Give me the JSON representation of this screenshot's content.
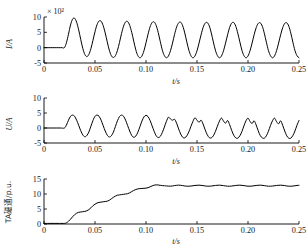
{
  "figure": {
    "background": "#ffffff",
    "line_color": "#000000",
    "panel_count": 3
  },
  "chart_data": [
    {
      "type": "line",
      "title": "",
      "xlabel": "t/s",
      "ylabel": "I/A",
      "y_multiplier": "× 10²",
      "xlim": [
        0,
        0.25
      ],
      "ylim": [
        -5,
        10
      ],
      "xticks": [
        0,
        0.05,
        0.1,
        0.15,
        0.2,
        0.25
      ],
      "xticklabels": [
        "0",
        "0.05",
        "0.10",
        "0.15",
        "0.20",
        "0.25"
      ],
      "yticks": [
        -5,
        0,
        5,
        10
      ],
      "yticklabels": [
        "-5",
        "0",
        "5",
        "10"
      ],
      "grid": false,
      "legend": "none",
      "description": "Primary current: flat at 0 until 0.02 s, then a 50 Hz sinusoid with DC offset; first peak ~9.7, decaying to a steady swing between about -3 and 7.",
      "series": [
        {
          "name": "I",
          "x": [
            0,
            0.002,
            0.004,
            0.006,
            0.008,
            0.01,
            0.012,
            0.014,
            0.016,
            0.018,
            0.02,
            0.022,
            0.024,
            0.026,
            0.028,
            0.03,
            0.032,
            0.034,
            0.036,
            0.038,
            0.04,
            0.042,
            0.044,
            0.046,
            0.048,
            0.05,
            0.052,
            0.054,
            0.056,
            0.058,
            0.06,
            0.062,
            0.064,
            0.066,
            0.068,
            0.07,
            0.072,
            0.074,
            0.076,
            0.078,
            0.08,
            0.082,
            0.084,
            0.086,
            0.088,
            0.09,
            0.092,
            0.094,
            0.096,
            0.098,
            0.1,
            0.102,
            0.104,
            0.106,
            0.108,
            0.11,
            0.112,
            0.114,
            0.116,
            0.118,
            0.12,
            0.122,
            0.124,
            0.126,
            0.128,
            0.13,
            0.132,
            0.134,
            0.136,
            0.138,
            0.14,
            0.142,
            0.144,
            0.146,
            0.148,
            0.15,
            0.152,
            0.154,
            0.156,
            0.158,
            0.16,
            0.162,
            0.164,
            0.166,
            0.168,
            0.17,
            0.172,
            0.174,
            0.176,
            0.178,
            0.18,
            0.182,
            0.184,
            0.186,
            0.188,
            0.19,
            0.192,
            0.194,
            0.196,
            0.198,
            0.2,
            0.202,
            0.204,
            0.206,
            0.208,
            0.21,
            0.212,
            0.214,
            0.216,
            0.218,
            0.22,
            0.222,
            0.224,
            0.226,
            0.228,
            0.23,
            0.232,
            0.234,
            0.236,
            0.238,
            0.24,
            0.242,
            0.244,
            0.246,
            0.248,
            0.25
          ],
          "y": [
            0,
            0,
            0,
            0,
            0,
            0,
            0,
            0,
            0,
            0,
            0,
            1.6,
            4.4,
            7.4,
            9.3,
            9.6,
            8.3,
            5.8,
            2.7,
            -0.2,
            -2.2,
            -2.9,
            -2.2,
            -0.3,
            2.4,
            5.2,
            7.5,
            8.7,
            8.6,
            7.2,
            4.8,
            1.9,
            -0.8,
            -2.6,
            -3.2,
            -2.6,
            -0.9,
            1.7,
            4.6,
            7.0,
            8.4,
            8.5,
            7.3,
            5.0,
            2.1,
            -0.7,
            -2.6,
            -3.3,
            -2.7,
            -1.0,
            1.6,
            4.4,
            6.8,
            8.2,
            8.4,
            7.2,
            4.9,
            2.0,
            -0.8,
            -2.6,
            -3.3,
            -2.7,
            -1.0,
            1.5,
            4.3,
            6.7,
            8.1,
            8.3,
            7.1,
            4.8,
            1.9,
            -0.8,
            -2.6,
            -3.3,
            -2.7,
            -1.0,
            1.5,
            4.2,
            6.6,
            8.0,
            8.2,
            7.1,
            4.8,
            1.9,
            -0.8,
            -2.6,
            -3.3,
            -2.7,
            -1.0,
            1.5,
            4.2,
            6.6,
            8.0,
            8.2,
            7.0,
            4.7,
            1.9,
            -0.8,
            -2.6,
            -3.3,
            -2.7,
            -1.0,
            1.5,
            4.2,
            6.5,
            7.9,
            8.1,
            7.0,
            4.7,
            1.8,
            -0.9,
            -2.6,
            -3.3,
            -2.7,
            -1.0,
            1.5,
            4.2,
            6.5,
            7.9,
            8.1,
            7.0,
            4.7,
            1.8,
            -0.9,
            -2.6,
            -3.3
          ]
        }
      ]
    },
    {
      "type": "line",
      "title": "",
      "xlabel": "t/s",
      "ylabel": "U/A",
      "y_multiplier": "",
      "xlim": [
        0,
        0.25
      ],
      "ylim": [
        -5,
        10
      ],
      "xticks": [
        0,
        0.05,
        0.1,
        0.15,
        0.2,
        0.25
      ],
      "xticklabels": [
        "0",
        "0.05",
        "0.10",
        "0.15",
        "0.20",
        "0.25"
      ],
      "yticks": [
        -5,
        0,
        5,
        10
      ],
      "yticklabels": [
        "-5",
        "0",
        "5",
        "10"
      ],
      "grid": false,
      "legend": "none",
      "description": "Secondary current: zero until 0.02 s, clean sinusoid of about ±4 until roughly 0.11 s, then progressively distorted saturated waveform with notched, sawtooth-shaped peaks.",
      "series": [
        {
          "name": "U",
          "x": [
            0,
            0.004,
            0.008,
            0.012,
            0.016,
            0.02,
            0.022,
            0.024,
            0.026,
            0.028,
            0.03,
            0.032,
            0.034,
            0.036,
            0.038,
            0.04,
            0.042,
            0.044,
            0.046,
            0.048,
            0.05,
            0.052,
            0.054,
            0.056,
            0.058,
            0.06,
            0.062,
            0.064,
            0.066,
            0.068,
            0.07,
            0.072,
            0.074,
            0.076,
            0.078,
            0.08,
            0.082,
            0.084,
            0.086,
            0.088,
            0.09,
            0.092,
            0.094,
            0.096,
            0.098,
            0.1,
            0.102,
            0.104,
            0.106,
            0.108,
            0.11,
            0.112,
            0.114,
            0.116,
            0.118,
            0.12,
            0.122,
            0.124,
            0.126,
            0.128,
            0.13,
            0.132,
            0.134,
            0.136,
            0.138,
            0.14,
            0.142,
            0.144,
            0.146,
            0.148,
            0.15,
            0.152,
            0.154,
            0.156,
            0.158,
            0.16,
            0.162,
            0.164,
            0.166,
            0.168,
            0.17,
            0.172,
            0.174,
            0.176,
            0.178,
            0.18,
            0.182,
            0.184,
            0.186,
            0.188,
            0.19,
            0.192,
            0.194,
            0.196,
            0.198,
            0.2,
            0.202,
            0.204,
            0.206,
            0.208,
            0.21,
            0.212,
            0.214,
            0.216,
            0.218,
            0.22,
            0.222,
            0.224,
            0.226,
            0.228,
            0.23,
            0.232,
            0.234,
            0.236,
            0.238,
            0.24,
            0.242,
            0.244,
            0.246,
            0.248,
            0.25
          ],
          "y": [
            0,
            0,
            0,
            0,
            0,
            0,
            1.0,
            2.6,
            3.9,
            4.3,
            3.9,
            2.6,
            0.9,
            -0.9,
            -2.3,
            -2.9,
            -2.5,
            -1.3,
            0.6,
            2.5,
            3.9,
            4.3,
            3.9,
            2.6,
            0.8,
            -1.0,
            -2.4,
            -3.0,
            -2.6,
            -1.4,
            0.5,
            2.4,
            3.8,
            4.3,
            3.9,
            2.6,
            0.8,
            -1.0,
            -2.5,
            -3.1,
            -2.7,
            -1.4,
            0.4,
            2.3,
            3.7,
            4.2,
            3.8,
            2.5,
            0.7,
            -1.1,
            -2.6,
            -3.2,
            -2.8,
            -1.5,
            0.3,
            2.2,
            3.6,
            3.0,
            2.6,
            2.9,
            1.6,
            -0.3,
            -2.0,
            -3.1,
            -3.3,
            -2.6,
            -1.3,
            0.5,
            2.2,
            3.4,
            2.6,
            1.9,
            2.6,
            1.3,
            -0.6,
            -2.2,
            -3.2,
            -3.3,
            -2.6,
            -1.2,
            0.6,
            2.3,
            3.3,
            2.3,
            1.6,
            2.5,
            1.1,
            -0.8,
            -2.4,
            -3.3,
            -3.4,
            -2.6,
            -1.2,
            0.7,
            2.4,
            3.3,
            2.2,
            1.5,
            2.4,
            1.0,
            -0.9,
            -2.5,
            -3.3,
            -3.4,
            -2.6,
            -1.1,
            0.8,
            2.4,
            3.3,
            2.1,
            1.4,
            2.4,
            0.9,
            -1.0,
            -2.6,
            -3.4,
            -3.4,
            -2.5,
            -1.0,
            0.9,
            2.5,
            3.3
          ]
        }
      ]
    },
    {
      "type": "line",
      "title": "",
      "xlabel": "t/s",
      "ylabel": "TA磁通/p.u.",
      "y_multiplier": "",
      "xlim": [
        0,
        0.25
      ],
      "ylim": [
        0,
        15
      ],
      "xticks": [
        0,
        0.05,
        0.1,
        0.15,
        0.2,
        0.25
      ],
      "xticklabels": [
        "0",
        "0.05",
        "0.10",
        "0.15",
        "0.20",
        "0.25"
      ],
      "yticks": [
        0,
        5,
        10,
        15
      ],
      "yticklabels": [
        "0",
        "5",
        "10",
        "15"
      ],
      "grid": false,
      "legend": "none",
      "description": "Current-transformer flux in per-unit: flat near 0 until 0.02 s, then a stair-stepped rise reaching about 12.7 at 0.12 s, afterwards a small steady ripple around 12.7.",
      "series": [
        {
          "name": "TA flux",
          "x": [
            0,
            0.005,
            0.01,
            0.015,
            0.02,
            0.022,
            0.024,
            0.026,
            0.028,
            0.03,
            0.032,
            0.034,
            0.036,
            0.038,
            0.04,
            0.042,
            0.044,
            0.046,
            0.048,
            0.05,
            0.052,
            0.054,
            0.056,
            0.058,
            0.06,
            0.062,
            0.064,
            0.066,
            0.068,
            0.07,
            0.072,
            0.074,
            0.076,
            0.078,
            0.08,
            0.082,
            0.084,
            0.086,
            0.088,
            0.09,
            0.092,
            0.094,
            0.096,
            0.098,
            0.1,
            0.102,
            0.104,
            0.106,
            0.108,
            0.11,
            0.112,
            0.114,
            0.116,
            0.118,
            0.12,
            0.124,
            0.128,
            0.132,
            0.136,
            0.14,
            0.144,
            0.148,
            0.152,
            0.156,
            0.16,
            0.164,
            0.168,
            0.172,
            0.176,
            0.18,
            0.184,
            0.188,
            0.192,
            0.196,
            0.2,
            0.204,
            0.208,
            0.212,
            0.216,
            0.22,
            0.224,
            0.228,
            0.232,
            0.236,
            0.24,
            0.244,
            0.248,
            0.25
          ],
          "y": [
            0.2,
            0.2,
            0.2,
            0.2,
            0.2,
            0.4,
            0.9,
            1.6,
            2.4,
            3.1,
            3.6,
            3.9,
            4.0,
            4.1,
            4.2,
            4.4,
            4.8,
            5.4,
            6.1,
            6.6,
            7.0,
            7.2,
            7.3,
            7.4,
            7.5,
            7.6,
            7.9,
            8.4,
            8.9,
            9.3,
            9.6,
            9.7,
            9.8,
            9.9,
            10.0,
            10.1,
            10.4,
            10.8,
            11.2,
            11.5,
            11.7,
            11.8,
            11.85,
            11.9,
            11.95,
            12.1,
            12.4,
            12.7,
            12.95,
            13.05,
            13.0,
            12.9,
            12.8,
            12.75,
            12.7,
            12.6,
            12.8,
            12.95,
            12.8,
            12.6,
            12.65,
            12.85,
            12.95,
            12.8,
            12.6,
            12.65,
            12.85,
            12.95,
            12.8,
            12.6,
            12.65,
            12.85,
            12.95,
            12.8,
            12.6,
            12.65,
            12.85,
            12.95,
            12.8,
            12.6,
            12.65,
            12.85,
            12.95,
            12.8,
            12.6,
            12.65,
            12.85,
            12.9
          ]
        }
      ]
    }
  ]
}
